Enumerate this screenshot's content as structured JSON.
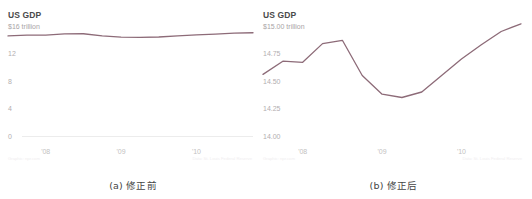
{
  "figure": {
    "panels": [
      {
        "id": "panel-a",
        "caption": "(a) 修正前",
        "title": "US GDP",
        "credit_left": "Graphic: npr.com",
        "credit_right": "Data: St. Louis Federal Reserve"
      },
      {
        "id": "panel-b",
        "caption": "(b) 修正后",
        "title": "US GDP",
        "credit_left": "Graphic: npr.com",
        "credit_right": "Data: St. Louis Federal Reserve"
      }
    ]
  },
  "chart_data": [
    {
      "id": "chart-before",
      "type": "line",
      "title": "US GDP",
      "xlabel": "",
      "ylabel": "",
      "ylim": [
        0,
        16
      ],
      "yticks": [
        16,
        12,
        8,
        4,
        0
      ],
      "ytick_labels": [
        "$16 trillion",
        "12",
        "8",
        "4",
        "0"
      ],
      "grid": false,
      "baseline_at_zero": true,
      "legend": "none",
      "xlim": [
        2007.5,
        2010.75
      ],
      "xticks": [
        2008,
        2009,
        2010
      ],
      "xtick_labels": [
        "'08",
        "'09",
        "'10"
      ],
      "series": [
        {
          "name": "US GDP (trillions of dollars)",
          "color": "#8d6b78",
          "x": [
            2007.5,
            2007.75,
            2008.0,
            2008.25,
            2008.5,
            2008.75,
            2009.0,
            2009.25,
            2009.5,
            2009.75,
            2010.0,
            2010.25,
            2010.5,
            2010.75
          ],
          "values": [
            14.56,
            14.68,
            14.67,
            14.84,
            14.87,
            14.55,
            14.38,
            14.35,
            14.4,
            14.55,
            14.7,
            14.83,
            14.95,
            15.02
          ]
        }
      ]
    },
    {
      "id": "chart-after",
      "type": "line",
      "title": "US GDP",
      "xlabel": "",
      "ylabel": "",
      "ylim": [
        14.0,
        15.0
      ],
      "yticks": [
        15.0,
        14.75,
        14.5,
        14.25,
        14.0
      ],
      "ytick_labels": [
        "$15.00 trillion",
        "14.75",
        "14.50",
        "14.25",
        "14.00"
      ],
      "grid": false,
      "baseline_at_zero": false,
      "legend": "none",
      "xlim": [
        2007.5,
        2010.75
      ],
      "xticks": [
        2008,
        2009,
        2010
      ],
      "xtick_labels": [
        "'08",
        "'09",
        "'10"
      ],
      "series": [
        {
          "name": "US GDP (trillions of dollars)",
          "color": "#8d6b78",
          "x": [
            2007.5,
            2007.75,
            2008.0,
            2008.25,
            2008.5,
            2008.75,
            2009.0,
            2009.25,
            2009.5,
            2009.75,
            2010.0,
            2010.25,
            2010.5,
            2010.75
          ],
          "values": [
            14.56,
            14.68,
            14.67,
            14.84,
            14.87,
            14.55,
            14.38,
            14.35,
            14.4,
            14.55,
            14.7,
            14.83,
            14.95,
            15.02
          ]
        }
      ]
    }
  ]
}
